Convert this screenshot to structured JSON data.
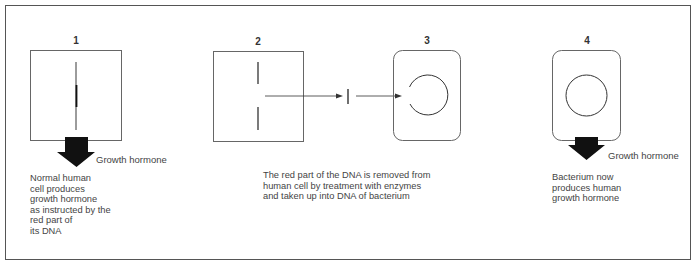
{
  "figure": {
    "steps": [
      {
        "number": "1",
        "output_label": "Growth hormone",
        "description": "Normal human\ncell produces\ngrowth hormone\nas instructed by the\nred part of\nits DNA"
      },
      {
        "number": "2"
      },
      {
        "number": "3",
        "description": "The red part of the DNA is removed from\nhuman cell by treatment with enzymes\nand taken up into DNA of bacterium"
      },
      {
        "number": "4",
        "output_label": "Growth hormone",
        "description": "Bacterium now\nproduces human\ngrowth hormone"
      }
    ],
    "colors": {
      "outline": "#555555",
      "arrow_fill": "#111111",
      "text": "#444444"
    }
  }
}
